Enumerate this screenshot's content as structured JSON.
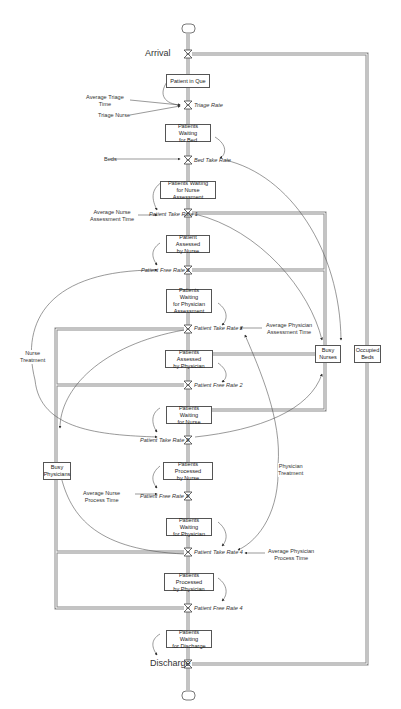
{
  "diagram": {
    "type": "stock-and-flow",
    "source_label": "Arrival",
    "sink_label": "Discharge",
    "stocks": [
      {
        "id": "s1",
        "label": "Patient in Que"
      },
      {
        "id": "s2",
        "label": "Patients Waiting\nfor Bed"
      },
      {
        "id": "s3",
        "label": "Patients Waiting\nfor Nurse Assessment"
      },
      {
        "id": "s4",
        "label": "Patient Assessed\nby Nurse"
      },
      {
        "id": "s5",
        "label": "Patients Waiting\nfor Physician\nAssessment"
      },
      {
        "id": "s6",
        "label": "Patients Assessed\nby Physician"
      },
      {
        "id": "s7",
        "label": "Patients Waiting\nfor Nurse"
      },
      {
        "id": "s8",
        "label": "Patients Processed\nby Nurse"
      },
      {
        "id": "s9",
        "label": "Patients Waiting\nfor Physician"
      },
      {
        "id": "s10",
        "label": "Patients Processed\nby Physician"
      },
      {
        "id": "s11",
        "label": "Patients Waiting\nfor Discharge"
      },
      {
        "id": "busy_nurses",
        "label": "Busy\nNurses"
      },
      {
        "id": "occupied_beds",
        "label": "Occupied\nBeds"
      },
      {
        "id": "busy_physicians",
        "label": "Busy\nPhysicians"
      }
    ],
    "rates": [
      {
        "id": "r1",
        "label": "Triage Rate"
      },
      {
        "id": "r2",
        "label": "Bed Take Rate"
      },
      {
        "id": "r3",
        "label": "Patient Take Rate 1"
      },
      {
        "id": "r4",
        "label": "Patient Free Rate 1"
      },
      {
        "id": "r5",
        "label": "Patient Take Rate 2"
      },
      {
        "id": "r6",
        "label": "Patient Free Rate 2"
      },
      {
        "id": "r7",
        "label": "Patient Take Rate 3"
      },
      {
        "id": "r8",
        "label": "Patient Free Rate 3"
      },
      {
        "id": "r9",
        "label": "Patient Take Rate 4"
      },
      {
        "id": "r10",
        "label": "Patient Free Rate 4"
      }
    ],
    "auxiliaries": [
      {
        "id": "a1",
        "label": "Average Triage\nTime"
      },
      {
        "id": "a2",
        "label": "Triage Nurse"
      },
      {
        "id": "a3",
        "label": "Beds"
      },
      {
        "id": "a4",
        "label": "Average Nurse\nAssessment Time"
      },
      {
        "id": "a5",
        "label": "Average Physician\nAssessment Time"
      },
      {
        "id": "a6",
        "label": "Nurse\nTreatment"
      },
      {
        "id": "a7",
        "label": "Average Nurse\nProcess Time"
      },
      {
        "id": "a8",
        "label": "Physician\nTreatment"
      },
      {
        "id": "a9",
        "label": "Average Physician\nProcess Time"
      }
    ],
    "colors": {
      "line": "#555555",
      "pipe": "#888888",
      "text": "#333333",
      "background": "#ffffff"
    }
  }
}
